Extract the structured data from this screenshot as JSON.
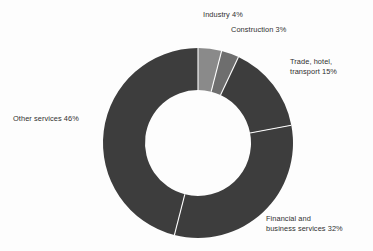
{
  "chart_data": {
    "type": "pie",
    "variant": "donut",
    "title": "",
    "subtitle": "",
    "xlabel": "",
    "ylabel": "",
    "grid": false,
    "legend": "none",
    "labels_position": "outside",
    "units": "percent",
    "total": 100,
    "start_angle_deg": 0,
    "direction": "clockwise",
    "categories": [
      "Industry",
      "Construction",
      "Trade, hotel, transport",
      "Financial and business services",
      "Other services"
    ],
    "values": [
      4,
      3,
      15,
      32,
      46
    ],
    "slices": [
      {
        "name": "Industry",
        "value": 4,
        "display_label": "Industry 4%",
        "color": "#8a8a8a",
        "start_deg": 0,
        "end_deg": 14.4
      },
      {
        "name": "Construction",
        "value": 3,
        "display_label": "Construction 3%",
        "color": "#6e6e6e",
        "start_deg": 14.4,
        "end_deg": 25.2
      },
      {
        "name": "Trade, hotel, transport",
        "value": 15,
        "display_label": "Trade, hotel,\ntransport 15%",
        "color": "#3d3d3d",
        "start_deg": 25.2,
        "end_deg": 79.2
      },
      {
        "name": "Financial and business services",
        "value": 32,
        "display_label": "Financial and\nbusiness services 32%",
        "color": "#3d3d3d",
        "start_deg": 79.2,
        "end_deg": 194.4
      },
      {
        "name": "Other services",
        "value": 46,
        "display_label": "Other services 46%",
        "color": "#3d3d3d",
        "start_deg": 194.4,
        "end_deg": 360
      }
    ]
  },
  "geometry": {
    "center_x": 198,
    "center_y": 143,
    "outer_radius": 95,
    "inner_radius": 53,
    "separator_color": "#fdfdfd",
    "separator_width": 1.1
  },
  "colors": {
    "background": "#fdfdfd",
    "dark_slice": "#3d3d3d",
    "mid_slice": "#6e6e6e",
    "light_slice": "#8a8a8a",
    "label_text": "#2f2f2f"
  }
}
